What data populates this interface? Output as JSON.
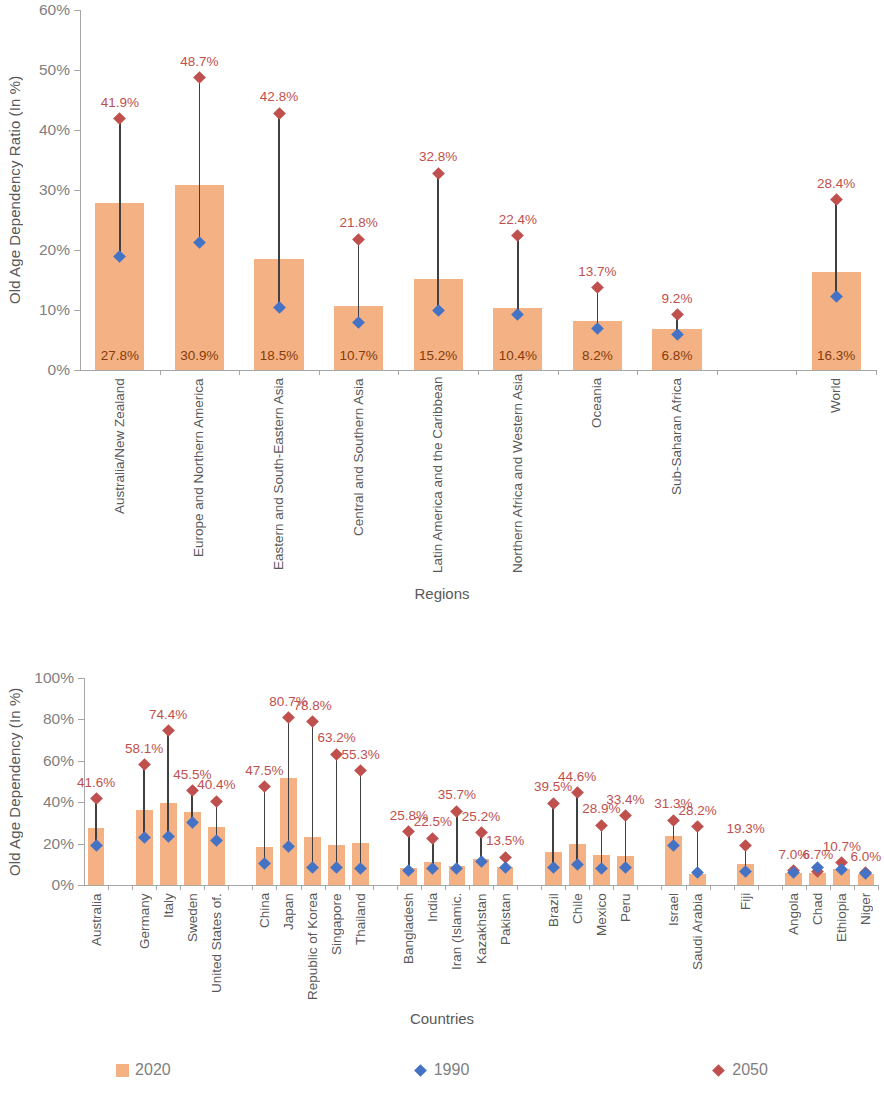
{
  "chart_data": [
    {
      "type": "bar",
      "title": "",
      "xlabel": "Regions",
      "ylabel": "Old Age Dependency Ratio (In %)",
      "ylim": [
        0,
        60
      ],
      "yticks": [
        "0%",
        "10%",
        "20%",
        "30%",
        "40%",
        "50%",
        "60%"
      ],
      "grid": false,
      "legend_position": "bottom",
      "categories": [
        "Australia/New Zealand",
        "Europe and Northern America",
        "Eastern and South-Eastern Asia",
        "Central and Southern Asia",
        "Latin America and the Caribbean",
        "Northern Africa and Western Asia",
        "Oceania",
        "Sub-Saharan Africa",
        "",
        "World"
      ],
      "series": [
        {
          "name": "2020",
          "kind": "bar",
          "values": [
            27.8,
            30.9,
            18.5,
            10.7,
            15.2,
            10.4,
            8.2,
            6.8,
            null,
            16.3
          ],
          "labels": [
            "27.8%",
            "30.9%",
            "18.5%",
            "10.7%",
            "15.2%",
            "10.4%",
            "8.2%",
            "6.8%",
            null,
            "16.3%"
          ]
        },
        {
          "name": "1990",
          "kind": "marker",
          "values": [
            19.0,
            21.3,
            10.5,
            8.0,
            10.0,
            9.3,
            6.9,
            5.9,
            null,
            12.3
          ],
          "labels": [
            null,
            null,
            null,
            null,
            null,
            null,
            null,
            null,
            null,
            null
          ]
        },
        {
          "name": "2050",
          "kind": "marker",
          "values": [
            41.9,
            48.7,
            42.8,
            21.8,
            32.8,
            22.4,
            13.7,
            9.2,
            null,
            28.4
          ],
          "labels": [
            "41.9%",
            "48.7%",
            "42.8%",
            "21.8%",
            "32.8%",
            "22.4%",
            "13.7%",
            "9.2%",
            null,
            "28.4%"
          ]
        }
      ]
    },
    {
      "type": "bar",
      "title": "",
      "xlabel": "Countries",
      "ylabel": "Old Age Dependency (In %)",
      "ylim": [
        0,
        100
      ],
      "yticks": [
        "0%",
        "20%",
        "40%",
        "60%",
        "80%",
        "100%"
      ],
      "grid": false,
      "legend_position": "bottom",
      "categories": [
        "Australia",
        "",
        "Germany",
        "Italy",
        "Sweden",
        "United States of.",
        "",
        "China",
        "Japan",
        "Republic of Korea",
        "Singapore",
        "Thailand",
        "",
        "Bangladesh",
        "India",
        "Iran (Islamic.",
        "Kazakhstan",
        "Pakistan",
        "",
        "Brazil",
        "Chile",
        "Mexico",
        "Peru",
        "",
        "Israel",
        "Saudi Arabia",
        "",
        "Fiji",
        "",
        "Angola",
        "Chad",
        "Ethiopia",
        "Niger"
      ],
      "series": [
        {
          "name": "2020",
          "kind": "bar",
          "values": [
            27.5,
            null,
            36.0,
            39.5,
            35.5,
            27.8,
            null,
            18.5,
            51.5,
            23.0,
            19.5,
            20.5,
            null,
            8.2,
            11.0,
            9.0,
            12.5,
            8.5,
            null,
            16.0,
            20.0,
            14.5,
            14.0,
            null,
            23.5,
            5.5,
            null,
            10.0,
            null,
            6.0,
            6.0,
            7.5,
            5.5
          ],
          "labels": [
            null,
            null,
            null,
            null,
            null,
            null,
            null,
            null,
            null,
            null,
            null,
            null,
            null,
            null,
            null,
            null,
            null,
            null,
            null,
            null,
            null,
            null,
            null,
            null,
            null,
            null,
            null,
            null,
            null,
            null,
            null,
            null,
            null
          ]
        },
        {
          "name": "1990",
          "kind": "marker",
          "values": [
            19.0,
            null,
            23.0,
            23.5,
            30.0,
            21.5,
            null,
            10.5,
            18.5,
            8.5,
            8.5,
            8.0,
            null,
            7.0,
            8.0,
            8.0,
            11.5,
            8.5,
            null,
            8.5,
            10.0,
            8.0,
            8.5,
            null,
            19.0,
            6.0,
            null,
            6.5,
            null,
            6.0,
            8.5,
            7.5,
            5.5
          ],
          "labels": [
            null,
            null,
            null,
            null,
            null,
            null,
            null,
            null,
            null,
            null,
            null,
            null,
            null,
            null,
            null,
            null,
            null,
            null,
            null,
            null,
            null,
            null,
            null,
            null,
            null,
            null,
            null,
            null,
            null,
            null,
            null,
            null,
            null
          ]
        },
        {
          "name": "2050",
          "kind": "marker",
          "values": [
            41.6,
            null,
            58.1,
            74.4,
            45.5,
            40.4,
            null,
            47.5,
            80.7,
            78.8,
            63.2,
            55.3,
            null,
            25.8,
            22.5,
            35.7,
            25.2,
            13.5,
            null,
            39.5,
            44.6,
            28.9,
            33.4,
            null,
            31.3,
            28.2,
            null,
            19.3,
            null,
            7.0,
            6.7,
            10.7,
            6.0
          ],
          "labels": [
            "41.6%",
            null,
            "58.1%",
            "74.4%",
            "45.5%",
            "40.4%",
            null,
            "47.5%",
            "80.7%",
            "78.8%",
            "63.2%",
            "55.3%",
            null,
            "25.8%",
            "22.5%",
            "35.7%",
            "25.2%",
            "13.5%",
            null,
            "39.5%",
            "44.6%",
            "28.9%",
            "33.4%",
            null,
            "31.3%",
            "28.2%",
            null,
            "19.3%",
            null,
            "7.0%",
            "6.7%",
            "10.7%",
            "6.0%"
          ]
        }
      ]
    }
  ],
  "legend": {
    "items": [
      {
        "label": "2020",
        "marker": "square",
        "color": "#F4B183"
      },
      {
        "label": "1990",
        "marker": "diamond",
        "color": "#4472C4"
      },
      {
        "label": "2050",
        "marker": "diamond",
        "color": "#C0504D"
      }
    ]
  },
  "colors": {
    "bar_2020": "#F4B183",
    "marker_1990": "#4472C4",
    "marker_2050": "#C0504D",
    "label_2050": "#C0504D",
    "label_bar": "#843C0C",
    "axis": "#a6a6a6",
    "text": "#595959"
  }
}
